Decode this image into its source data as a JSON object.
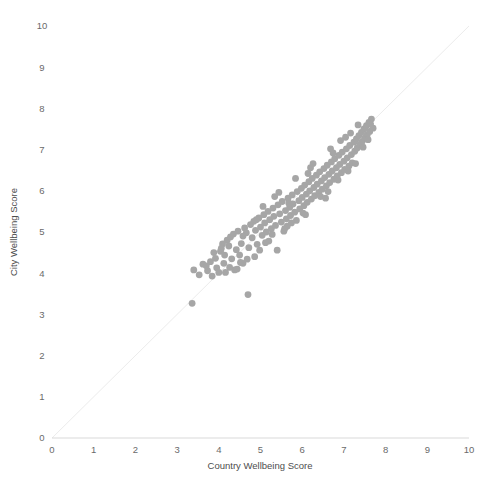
{
  "chart_data": {
    "type": "scatter",
    "title": "",
    "xlabel": "Country Wellbeing Score",
    "ylabel": "City Wellbeing Score",
    "xlim": [
      0,
      10
    ],
    "ylim": [
      0,
      10
    ],
    "xticks": [
      0,
      1,
      2,
      3,
      4,
      5,
      6,
      7,
      8,
      9,
      10
    ],
    "yticks": [
      0,
      1,
      2,
      3,
      4,
      5,
      6,
      7,
      8,
      9,
      10
    ],
    "xtick_labels": [
      "0",
      "1",
      "2",
      "3",
      "4",
      "5",
      "6",
      "7",
      "8",
      "9",
      "10"
    ],
    "ytick_labels": [
      "0",
      "1",
      "2",
      "3",
      "4",
      "5",
      "6",
      "7",
      "8",
      "9",
      "10"
    ],
    "grid": false,
    "legend": null,
    "marker_color": "#a6a6a6",
    "marker_size": 3.4,
    "reference_line": {
      "name": "identity-line",
      "type": "line",
      "from": [
        0,
        0
      ],
      "to": [
        10,
        10
      ],
      "color": "#ececec",
      "width": 1
    },
    "axis_color": "#d9d9d9",
    "series": [
      {
        "name": "City vs Country Wellbeing",
        "points": [
          [
            3.36,
            3.27
          ],
          [
            3.4,
            4.08
          ],
          [
            3.53,
            3.96
          ],
          [
            3.62,
            4.22
          ],
          [
            3.73,
            4.06
          ],
          [
            3.8,
            4.28
          ],
          [
            3.84,
            3.93
          ],
          [
            3.88,
            4.5
          ],
          [
            3.95,
            4.13
          ],
          [
            4.0,
            4.02
          ],
          [
            4.04,
            4.53
          ],
          [
            4.09,
            4.71
          ],
          [
            4.12,
            4.24
          ],
          [
            4.16,
            4.02
          ],
          [
            4.2,
            4.8
          ],
          [
            4.24,
            4.66
          ],
          [
            4.28,
            4.88
          ],
          [
            4.31,
            4.35
          ],
          [
            4.35,
            4.95
          ],
          [
            4.38,
            4.08
          ],
          [
            4.42,
            4.57
          ],
          [
            4.46,
            5.02
          ],
          [
            4.5,
            4.44
          ],
          [
            4.54,
            4.72
          ],
          [
            4.58,
            4.24
          ],
          [
            4.62,
            5.1
          ],
          [
            4.66,
            4.98
          ],
          [
            4.7,
            3.48
          ],
          [
            4.72,
            4.62
          ],
          [
            4.76,
            5.18
          ],
          [
            4.8,
            4.86
          ],
          [
            4.84,
            5.26
          ],
          [
            4.88,
            5.04
          ],
          [
            4.92,
            4.7
          ],
          [
            4.96,
            5.34
          ],
          [
            5.0,
            5.12
          ],
          [
            5.04,
            4.92
          ],
          [
            5.08,
            5.42
          ],
          [
            5.1,
            5.22
          ],
          [
            5.14,
            5.0
          ],
          [
            5.18,
            5.5
          ],
          [
            5.22,
            5.3
          ],
          [
            5.26,
            5.08
          ],
          [
            5.3,
            5.58
          ],
          [
            5.32,
            5.38
          ],
          [
            5.36,
            5.16
          ],
          [
            5.4,
            4.56
          ],
          [
            5.42,
            5.66
          ],
          [
            5.46,
            5.44
          ],
          [
            5.5,
            5.24
          ],
          [
            5.52,
            5.74
          ],
          [
            5.56,
            5.02
          ],
          [
            5.6,
            5.52
          ],
          [
            5.62,
            5.32
          ],
          [
            5.66,
            5.82
          ],
          [
            5.7,
            5.6
          ],
          [
            5.72,
            5.4
          ],
          [
            5.76,
            5.9
          ],
          [
            5.78,
            5.68
          ],
          [
            5.82,
            5.48
          ],
          [
            5.86,
            5.28
          ],
          [
            5.88,
            5.98
          ],
          [
            5.92,
            5.76
          ],
          [
            5.94,
            5.56
          ],
          [
            5.98,
            6.06
          ],
          [
            6.0,
            5.84
          ],
          [
            6.04,
            5.64
          ],
          [
            6.06,
            6.14
          ],
          [
            6.1,
            5.92
          ],
          [
            6.12,
            5.72
          ],
          [
            6.16,
            6.22
          ],
          [
            6.18,
            6.0
          ],
          [
            6.22,
            5.8
          ],
          [
            6.24,
            6.3
          ],
          [
            6.28,
            6.08
          ],
          [
            6.3,
            5.88
          ],
          [
            6.34,
            6.38
          ],
          [
            6.36,
            6.16
          ],
          [
            6.4,
            5.96
          ],
          [
            6.42,
            6.46
          ],
          [
            6.46,
            6.24
          ],
          [
            6.48,
            6.04
          ],
          [
            6.52,
            6.54
          ],
          [
            6.54,
            6.32
          ],
          [
            6.58,
            6.12
          ],
          [
            6.6,
            6.62
          ],
          [
            6.64,
            6.4
          ],
          [
            6.66,
            6.2
          ],
          [
            6.7,
            6.7
          ],
          [
            6.72,
            6.48
          ],
          [
            6.76,
            6.28
          ],
          [
            6.78,
            6.78
          ],
          [
            6.82,
            6.56
          ],
          [
            6.84,
            6.36
          ],
          [
            6.88,
            6.86
          ],
          [
            6.9,
            6.64
          ],
          [
            6.94,
            6.44
          ],
          [
            6.96,
            6.94
          ],
          [
            7.0,
            6.72
          ],
          [
            7.02,
            6.52
          ],
          [
            7.06,
            7.02
          ],
          [
            7.08,
            6.8
          ],
          [
            7.12,
            6.6
          ],
          [
            7.14,
            7.1
          ],
          [
            7.18,
            6.88
          ],
          [
            7.2,
            6.68
          ],
          [
            7.24,
            7.18
          ],
          [
            7.26,
            6.96
          ],
          [
            7.3,
            7.26
          ],
          [
            7.32,
            7.04
          ],
          [
            7.36,
            7.34
          ],
          [
            7.38,
            7.12
          ],
          [
            7.42,
            7.42
          ],
          [
            7.44,
            7.2
          ],
          [
            7.48,
            7.5
          ],
          [
            7.5,
            7.28
          ],
          [
            7.54,
            7.58
          ],
          [
            7.56,
            7.36
          ],
          [
            7.6,
            7.66
          ],
          [
            7.62,
            7.44
          ],
          [
            7.66,
            7.74
          ],
          [
            7.7,
            7.52
          ],
          [
            4.44,
            4.1
          ],
          [
            4.86,
            4.4
          ],
          [
            5.2,
            4.78
          ],
          [
            5.64,
            5.14
          ],
          [
            6.02,
            5.46
          ],
          [
            6.44,
            5.86
          ],
          [
            6.86,
            6.26
          ],
          [
            7.28,
            6.66
          ],
          [
            5.06,
            5.62
          ],
          [
            5.44,
            5.96
          ],
          [
            5.84,
            6.3
          ],
          [
            6.26,
            6.66
          ],
          [
            6.68,
            7.02
          ],
          [
            4.68,
            4.34
          ],
          [
            5.12,
            4.74
          ],
          [
            5.58,
            5.08
          ],
          [
            6.08,
            5.42
          ],
          [
            6.56,
            5.82
          ],
          [
            3.92,
            4.36
          ],
          [
            4.26,
            4.14
          ],
          [
            4.58,
            4.9
          ],
          [
            4.98,
            4.56
          ],
          [
            5.34,
            5.86
          ],
          [
            5.74,
            5.22
          ],
          [
            6.14,
            6.42
          ],
          [
            6.62,
            5.98
          ],
          [
            7.04,
            7.3
          ],
          [
            7.46,
            7.06
          ],
          [
            6.92,
            7.22
          ],
          [
            7.16,
            7.4
          ],
          [
            7.34,
            7.6
          ],
          [
            7.58,
            7.24
          ],
          [
            7.64,
            7.62
          ],
          [
            4.14,
            4.44
          ],
          [
            4.52,
            4.26
          ],
          [
            4.9,
            5.3
          ],
          [
            5.28,
            4.94
          ],
          [
            5.68,
            5.7
          ],
          [
            6.2,
            6.56
          ],
          [
            6.74,
            6.92
          ],
          [
            7.1,
            6.48
          ],
          [
            3.7,
            4.18
          ],
          [
            4.06,
            4.6
          ]
        ]
      }
    ]
  },
  "axes": {
    "x_title": "Country Wellbeing Score",
    "y_title": "City Wellbeing Score"
  }
}
